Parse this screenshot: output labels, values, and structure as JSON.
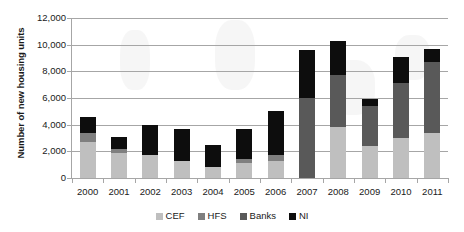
{
  "chart_data": {
    "type": "bar",
    "stacked": true,
    "title": "",
    "xlabel": "",
    "ylabel": "Number of new housing units",
    "ylim": [
      0,
      12000
    ],
    "ytick_step": 2000,
    "ytick_labels": [
      "0",
      "2,000",
      "4,000",
      "6,000",
      "8,000",
      "10,000",
      "12,000"
    ],
    "ytick_values": [
      0,
      2000,
      4000,
      6000,
      8000,
      10000,
      12000
    ],
    "grid": true,
    "legend_position": "bottom",
    "categories": [
      "2000",
      "2001",
      "2002",
      "2003",
      "2004",
      "2005",
      "2006",
      "2007",
      "2008",
      "2009",
      "2010",
      "2011"
    ],
    "series": [
      {
        "name": "CEF",
        "color": "#bfbfbf",
        "values": [
          2700,
          1900,
          1700,
          1250,
          800,
          1150,
          1250,
          0,
          3800,
          2400,
          3000,
          3400
        ]
      },
      {
        "name": "HFS",
        "color": "#7f7f7f",
        "values": [
          700,
          300,
          0,
          0,
          0,
          300,
          450,
          0,
          0,
          0,
          0,
          0
        ]
      },
      {
        "name": "Banks",
        "color": "#595959",
        "values": [
          0,
          0,
          0,
          0,
          0,
          0,
          0,
          6000,
          3900,
          3000,
          4100,
          5300
        ]
      },
      {
        "name": "NI",
        "color": "#0d0d0d",
        "values": [
          1150,
          850,
          2250,
          2450,
          1700,
          2200,
          3300,
          3600,
          2600,
          500,
          2000,
          1000
        ]
      }
    ],
    "totals": [
      4550,
      3050,
      3950,
      3700,
      2500,
      3650,
      5000,
      9600,
      10300,
      5900,
      9100,
      9700
    ]
  },
  "legend": {
    "items": [
      {
        "label": "CEF",
        "color": "#bfbfbf"
      },
      {
        "label": "HFS",
        "color": "#7f7f7f"
      },
      {
        "label": "Banks",
        "color": "#595959"
      },
      {
        "label": "NI",
        "color": "#0d0d0d"
      }
    ]
  }
}
